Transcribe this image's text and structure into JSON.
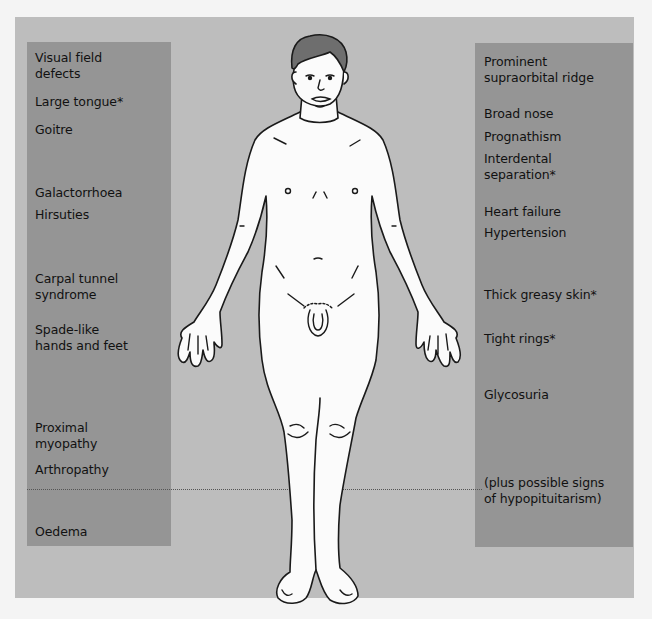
{
  "left_labels": [
    {
      "text": "Visual field\ndefects",
      "top": 8
    },
    {
      "text": "Large tongue*",
      "top": 52
    },
    {
      "text": "Goitre",
      "top": 80
    },
    {
      "text": "Galactorrhoea",
      "top": 143
    },
    {
      "text": "Hirsuties",
      "top": 165
    },
    {
      "text": "Carpal tunnel\nsyndrome",
      "top": 229
    },
    {
      "text": "Spade-like\nhands and feet",
      "top": 280
    },
    {
      "text": "Proximal\nmyopathy",
      "top": 378
    },
    {
      "text": "Arthropathy",
      "top": 420
    },
    {
      "text": "Oedema",
      "top": 482
    }
  ],
  "right_labels": [
    {
      "text": "Prominent\nsupraorbital ridge",
      "top": 11
    },
    {
      "text": "Broad nose",
      "top": 63
    },
    {
      "text": "Prognathism",
      "top": 86
    },
    {
      "text": "Interdental\nseparation*",
      "top": 108
    },
    {
      "text": "Heart failure",
      "top": 161
    },
    {
      "text": "Hypertension",
      "top": 182
    },
    {
      "text": "Thick greasy skin*",
      "top": 244
    },
    {
      "text": "Tight rings*",
      "top": 288
    },
    {
      "text": "Glycosuria",
      "top": 344
    },
    {
      "text": "(plus possible signs\nof hypopituitarism)",
      "top": 432
    }
  ],
  "figure": {
    "colors": {
      "frame_bg": "#bdbdbd",
      "panel_bg": "#959595",
      "body_fill": "#fbfbfb",
      "outline": "#1a1a1a",
      "hair": "#6e6e6e"
    }
  }
}
